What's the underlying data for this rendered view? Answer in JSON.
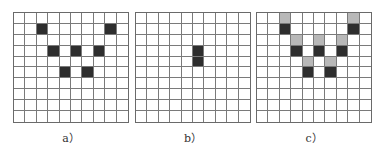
{
  "figure": {
    "rows": 10,
    "cols": 10,
    "colors": {
      "dark": "#2e2e2e",
      "gray": "#b8b8b8",
      "grid_line": "#7a7a7a",
      "background": "#ffffff"
    },
    "panels": [
      {
        "label": "a）",
        "dark_cells": [
          [
            1,
            2
          ],
          [
            1,
            8
          ],
          [
            3,
            3
          ],
          [
            3,
            5
          ],
          [
            3,
            7
          ],
          [
            5,
            4
          ],
          [
            5,
            6
          ]
        ],
        "gray_cells": []
      },
      {
        "label": "b）",
        "dark_cells": [
          [
            3,
            5
          ],
          [
            4,
            5
          ]
        ],
        "gray_cells": []
      },
      {
        "label": "c）",
        "dark_cells": [
          [
            1,
            2
          ],
          [
            1,
            8
          ],
          [
            3,
            3
          ],
          [
            3,
            5
          ],
          [
            3,
            7
          ],
          [
            5,
            4
          ],
          [
            5,
            6
          ]
        ],
        "gray_cells": [
          [
            0,
            2
          ],
          [
            0,
            8
          ],
          [
            2,
            3
          ],
          [
            2,
            5
          ],
          [
            2,
            7
          ],
          [
            4,
            4
          ],
          [
            4,
            6
          ]
        ]
      }
    ]
  }
}
